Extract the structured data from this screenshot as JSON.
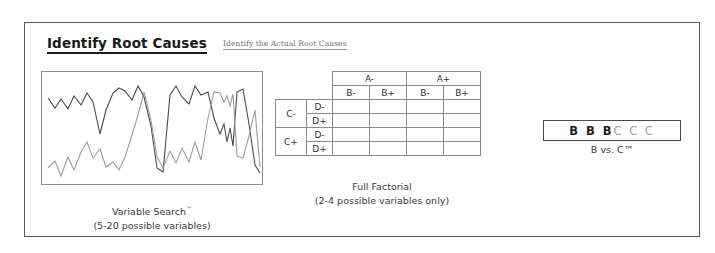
{
  "header": {
    "title": "Identify Root Causes",
    "subtitle": "Identify the Actual Root Causes"
  },
  "panels": {
    "variable_search": {
      "caption_line1": "Variable Search",
      "caption_tm": "™",
      "caption_line2": "(5-20 possible variables)"
    },
    "full_factorial": {
      "caption_line1": "Full Factorial",
      "caption_line2": "(2-4 possible variables only)",
      "table": {
        "col_group_headers": [
          "A-",
          "A+"
        ],
        "col_sub_headers": [
          "B-",
          "B+",
          "B-",
          "B+"
        ],
        "row_group_headers": [
          "C-",
          "C+"
        ],
        "row_sub_headers": [
          "D-",
          "D+",
          "D-",
          "D+"
        ],
        "cells": [
          [
            "",
            "",
            "",
            ""
          ],
          [
            "",
            "",
            "",
            ""
          ],
          [
            "",
            "",
            "",
            ""
          ],
          [
            "",
            "",
            "",
            ""
          ]
        ]
      }
    },
    "b_vs_c": {
      "b_group": "B B B",
      "c_group": "C C C",
      "caption": "B vs. C™"
    }
  },
  "colors": {
    "frame_border": "#5a5a5a",
    "chart_border": "#8d8d8d",
    "table_border": "#8a8a8a",
    "series_dark": "#4a4a4a",
    "series_light": "#9e9e9e",
    "title_text": "#1a1a1a",
    "caption_text": "#3a3a3a"
  },
  "chart_data": {
    "type": "line",
    "title": "Variable Search",
    "xlabel": "",
    "ylabel": "",
    "grid": false,
    "legend": "none",
    "xlim": [
      0,
      220
    ],
    "ylim": [
      0,
      112
    ],
    "series": [
      {
        "name": "dark-series",
        "color": "#4a4a4a",
        "points": [
          [
            6,
            26
          ],
          [
            13,
            36
          ],
          [
            19,
            27
          ],
          [
            26,
            37
          ],
          [
            32,
            24
          ],
          [
            39,
            33
          ],
          [
            45,
            21
          ],
          [
            51,
            30
          ],
          [
            58,
            62
          ],
          [
            64,
            38
          ],
          [
            71,
            21
          ],
          [
            77,
            16
          ],
          [
            83,
            19
          ],
          [
            90,
            28
          ],
          [
            96,
            14
          ],
          [
            102,
            25
          ],
          [
            109,
            54
          ],
          [
            115,
            96
          ],
          [
            121,
            100
          ],
          [
            128,
            23
          ],
          [
            134,
            14
          ],
          [
            140,
            25
          ],
          [
            147,
            32
          ],
          [
            153,
            14
          ],
          [
            159,
            23
          ],
          [
            166,
            20
          ],
          [
            172,
            46
          ],
          [
            178,
            62
          ],
          [
            182,
            52
          ],
          [
            185,
            70
          ],
          [
            188,
            56
          ],
          [
            191,
            74
          ],
          [
            195,
            20
          ],
          [
            201,
            17
          ],
          [
            207,
            52
          ],
          [
            213,
            93
          ],
          [
            218,
            101
          ]
        ]
      },
      {
        "name": "light-series",
        "color": "#9e9e9e",
        "points": [
          [
            6,
            96
          ],
          [
            13,
            89
          ],
          [
            19,
            104
          ],
          [
            26,
            85
          ],
          [
            32,
            98
          ],
          [
            39,
            80
          ],
          [
            45,
            70
          ],
          [
            51,
            86
          ],
          [
            58,
            77
          ],
          [
            64,
            95
          ],
          [
            71,
            90
          ],
          [
            77,
            98
          ],
          [
            83,
            85
          ],
          [
            90,
            63
          ],
          [
            96,
            43
          ],
          [
            102,
            20
          ],
          [
            109,
            48
          ],
          [
            115,
            85
          ],
          [
            121,
            96
          ],
          [
            128,
            79
          ],
          [
            134,
            91
          ],
          [
            140,
            76
          ],
          [
            147,
            90
          ],
          [
            153,
            70
          ],
          [
            159,
            88
          ],
          [
            166,
            46
          ],
          [
            172,
            20
          ],
          [
            178,
            21
          ],
          [
            182,
            30
          ],
          [
            185,
            24
          ],
          [
            188,
            34
          ],
          [
            191,
            22
          ],
          [
            195,
            84
          ],
          [
            201,
            86
          ],
          [
            207,
            64
          ],
          [
            213,
            38
          ],
          [
            218,
            95
          ]
        ]
      }
    ]
  }
}
